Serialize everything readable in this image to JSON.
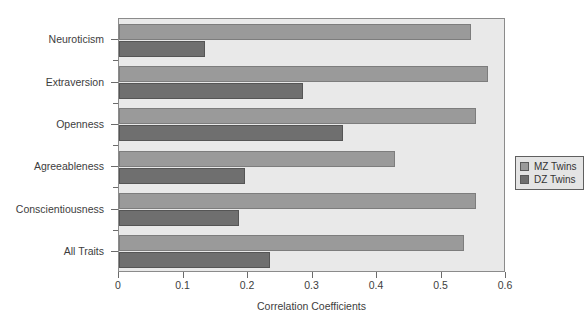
{
  "chart_data": {
    "type": "bar",
    "orientation": "horizontal",
    "title": "",
    "xlabel": "Correlation Coefficients",
    "ylabel": "",
    "xlim": [
      0,
      0.6
    ],
    "xticks": [
      "0",
      "0.1",
      "0.2",
      "0.3",
      "0.4",
      "0.5",
      "0.6"
    ],
    "xtick_values": [
      0,
      0.1,
      0.2,
      0.3,
      0.4,
      0.5,
      0.6
    ],
    "grid": false,
    "legend_position": "center-right",
    "categories": [
      "Neuroticism",
      "Extraversion",
      "Openness",
      "Agreeableness",
      "Conscientiousness",
      "All Traits"
    ],
    "series": [
      {
        "name": "MZ Twins",
        "color": "#9a9a9a",
        "values": [
          0.545,
          0.572,
          0.553,
          0.428,
          0.553,
          0.535
        ]
      },
      {
        "name": "DZ Twins",
        "color": "#6f6f6f",
        "values": [
          0.133,
          0.285,
          0.348,
          0.196,
          0.186,
          0.234
        ]
      }
    ]
  },
  "legend": {
    "entries": [
      {
        "label": "MZ Twins",
        "swatch": "mz"
      },
      {
        "label": "DZ Twins",
        "swatch": "dz"
      }
    ]
  },
  "colors": {
    "plot_background": "#e9e9e9",
    "plot_border": "#8b8b8b",
    "mz_bar": "#9a9a9a",
    "dz_bar": "#6f6f6f",
    "text": "#3d3d3d"
  }
}
